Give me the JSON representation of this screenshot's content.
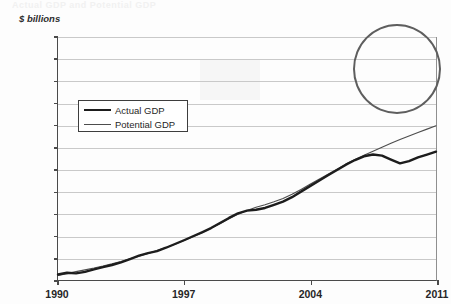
{
  "figure": {
    "top_remnant_text": "Actual GDP and Potential GDP",
    "y_axis_units": "$ billions"
  },
  "legend": {
    "items": [
      {
        "label": "Actual GDP",
        "style": "thick"
      },
      {
        "label": "Potential GDP",
        "style": "thin"
      }
    ]
  },
  "annotation": {
    "ellipse_name": "output-gap-highlight"
  },
  "chart_data": {
    "type": "line",
    "title": "Actual GDP and Potential GDP",
    "xlabel": "",
    "ylabel": "$ billions",
    "xlim": [
      1990,
      2011
    ],
    "ylim": [
      5500,
      16500
    ],
    "grid": true,
    "legend_position": "inside-left",
    "xtick_labels": [
      "1990",
      "1997",
      "2004",
      "2011"
    ],
    "xtick_values": [
      1990,
      1997,
      2004,
      2011
    ],
    "ytick_labels": [
      "$5,500",
      "$6,500",
      "$7,500",
      "$8,500",
      "$9,500",
      "$10,500",
      "$11,500",
      "$12,500",
      "$13,500",
      "$14,500",
      "$15,500",
      "$16,500"
    ],
    "ytick_values": [
      5500,
      6500,
      7500,
      8500,
      9500,
      10500,
      11500,
      12500,
      13500,
      14500,
      15500,
      16500
    ],
    "x": [
      1990,
      1990.5,
      1991,
      1991.5,
      1992,
      1992.5,
      1993,
      1993.5,
      1994,
      1994.5,
      1995,
      1995.5,
      1996,
      1996.5,
      1997,
      1997.5,
      1998,
      1998.5,
      1999,
      1999.5,
      2000,
      2000.5,
      2001,
      2001.5,
      2002,
      2002.5,
      2003,
      2003.5,
      2004,
      2004.5,
      2005,
      2005.5,
      2006,
      2006.5,
      2007,
      2007.5,
      2008,
      2008.5,
      2009,
      2009.5,
      2010,
      2010.5,
      2011
    ],
    "series": [
      {
        "name": "Actual GDP",
        "style": "thick",
        "values": [
          5750,
          5830,
          5800,
          5870,
          5980,
          6080,
          6180,
          6300,
          6450,
          6600,
          6720,
          6810,
          6960,
          7130,
          7300,
          7480,
          7660,
          7850,
          8080,
          8310,
          8520,
          8640,
          8680,
          8760,
          8900,
          9050,
          9250,
          9500,
          9750,
          9990,
          10240,
          10480,
          10720,
          10930,
          11100,
          11180,
          11130,
          10950,
          10780,
          10880,
          11050,
          11180,
          11310
        ]
      },
      {
        "name": "Potential GDP",
        "style": "thin",
        "values": [
          5700,
          5790,
          5880,
          5960,
          6040,
          6130,
          6230,
          6340,
          6460,
          6580,
          6700,
          6830,
          6970,
          7120,
          7290,
          7460,
          7640,
          7840,
          8050,
          8270,
          8480,
          8650,
          8790,
          8910,
          9040,
          9190,
          9380,
          9600,
          9830,
          10060,
          10290,
          10520,
          10750,
          10960,
          11150,
          11330,
          11510,
          11690,
          11860,
          12020,
          12180,
          12330,
          12480
        ]
      }
    ]
  }
}
